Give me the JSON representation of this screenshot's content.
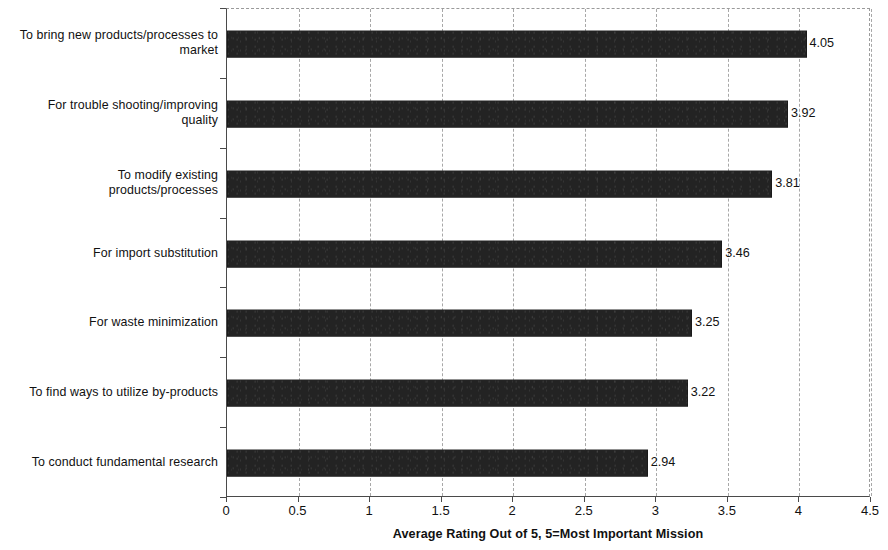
{
  "chart_data": {
    "type": "bar",
    "orientation": "horizontal",
    "title": "",
    "xlabel": "Average Rating Out of 5, 5=Most Important Mission",
    "ylabel": "",
    "xlim": [
      0,
      4.5
    ],
    "xticks": [
      "0",
      "0.5",
      "1",
      "1.5",
      "2",
      "2.5",
      "3",
      "3.5",
      "4",
      "4.5"
    ],
    "xtick_values": [
      0,
      0.5,
      1,
      1.5,
      2,
      2.5,
      3,
      3.5,
      4,
      4.5
    ],
    "grid": "vertical-dashed",
    "legend": "none",
    "bar_color": "#232323",
    "categories": [
      "To bring new products/processes to\nmarket",
      "For trouble shooting/improving\nquality",
      "To modify existing\nproducts/processes",
      "For import substitution",
      "For waste minimization",
      "To find ways to utilize by-products",
      "To conduct fundamental research"
    ],
    "values": [
      4.05,
      3.92,
      3.81,
      3.46,
      3.25,
      3.22,
      2.94
    ],
    "value_labels": [
      "4.05",
      "3.92",
      "3.81",
      "3.46",
      "3.25",
      "3.22",
      "2.94"
    ]
  }
}
